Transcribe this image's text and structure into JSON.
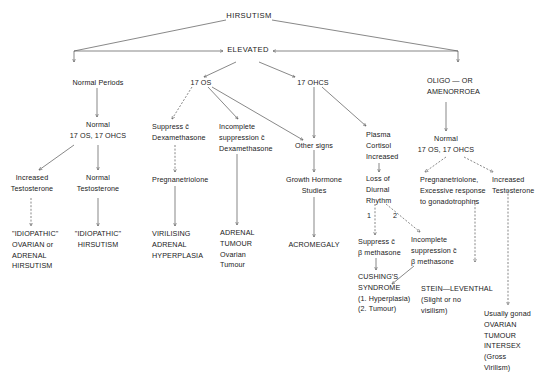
{
  "diagram": {
    "title": "HIRSUTISM",
    "nodes": {
      "hirsutism": [
        "HIRSUTISM"
      ],
      "elevated": [
        "ELEVATED"
      ],
      "normal_periods": [
        "Normal Periods"
      ],
      "normal_17os_left": [
        "Normal",
        "17 OS, 17 OHCS"
      ],
      "inc_testosterone_left": [
        "Increased",
        "Testosterone"
      ],
      "normal_testosterone": [
        "Normal",
        "Testosterone"
      ],
      "idiopathic_ovarian": [
        "\"IDIOPATHIC\"",
        "OVARIAN or",
        "ADRENAL",
        "HIRSUTISM"
      ],
      "idiopathic_hirsutism": [
        "\"IDIOPATHIC\"",
        "HIRSUTISM"
      ],
      "os17": [
        "17 OS"
      ],
      "suppress_dexa": [
        "Suppress c̄",
        "Dexamethasone"
      ],
      "pregnanetriolone": [
        "Pregnanetriolone"
      ],
      "virilising": [
        "VIRILISING",
        "ADRENAL",
        "HYPERPLASIA"
      ],
      "incomplete_dexa": [
        "Incomplete",
        "suppression c̄",
        "Dexamethasone"
      ],
      "adrenal_tumour": [
        "ADRENAL",
        "TUMOUR",
        "Ovarian",
        "Tumour"
      ],
      "ohcs17": [
        "17 OHCS"
      ],
      "other_signs": [
        "Other signs"
      ],
      "growth_hormone": [
        "Growth Hormone",
        "Studies"
      ],
      "acromegaly": [
        "ACROMEGALY"
      ],
      "plasma_cortisol": [
        "Plasma",
        "Cortisol",
        "Increased"
      ],
      "loss_diurnal": [
        "Loss of",
        "Diurnal",
        "Rhythm"
      ],
      "label_1": [
        "1"
      ],
      "label_2": [
        "2"
      ],
      "suppress_beta": [
        "Suppress c̄",
        "β methasone"
      ],
      "incomplete_beta": [
        "Incomplete",
        "suppression c̄",
        "β methasone"
      ],
      "cushings": [
        "CUSHING'S",
        "SYNDROME",
        "(1. Hyperplasia)",
        "(2. Tumour)"
      ],
      "oligo": [
        "OLIGO — OR",
        "AMENORROEA"
      ],
      "normal_17os_right": [
        "Normal",
        "17 OS, 17 OHCS"
      ],
      "preg_excessive": [
        "Pregnanetriolone,",
        "Excessive response",
        "to gonadotrophins"
      ],
      "inc_testosterone_right": [
        "Increased",
        "Testosterone"
      ],
      "stein": [
        "STEIN—LEVENTHAL",
        "(Slight or no",
        "visilism)"
      ],
      "gonad_tumour": [
        "Usually gonad",
        "OVARIAN",
        "TUMOUR",
        "INTERSEX",
        "(Gross",
        "Virilism)"
      ]
    }
  }
}
